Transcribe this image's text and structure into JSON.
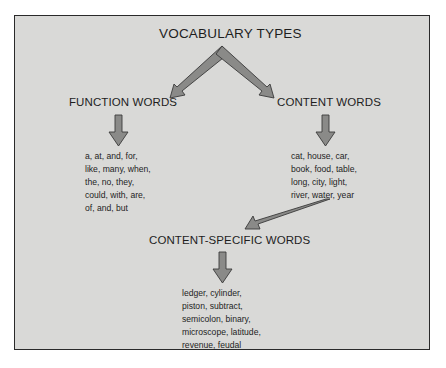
{
  "diagram": {
    "title": "VOCABULARY TYPES",
    "nodes": {
      "function_words": {
        "label": "FUNCTION WORDS",
        "examples": [
          "a, at, and, for,",
          "like, many, when,",
          "the, no, they,",
          "could, with, are,",
          "of, and, but"
        ]
      },
      "content_words": {
        "label": "CONTENT WORDS",
        "examples": [
          "cat, house, car,",
          "book, food, table,",
          "long, city, light,",
          "river, water, year"
        ]
      },
      "content_specific_words": {
        "label": "CONTENT-SPECIFIC WORDS",
        "examples": [
          "ledger, cylinder,",
          "piston, subtract,",
          "semicolon, binary,",
          "microscope, latitude,",
          "revenue, feudal"
        ]
      }
    },
    "edges": [
      {
        "from": "VOCABULARY TYPES",
        "to": "FUNCTION WORDS"
      },
      {
        "from": "VOCABULARY TYPES",
        "to": "CONTENT WORDS"
      },
      {
        "from": "FUNCTION WORDS",
        "to": "function word examples"
      },
      {
        "from": "CONTENT WORDS",
        "to": "content word examples"
      },
      {
        "from": "content word examples",
        "to": "CONTENT-SPECIFIC WORDS"
      },
      {
        "from": "CONTENT-SPECIFIC WORDS",
        "to": "content-specific word examples"
      }
    ],
    "colors": {
      "background": "#d9d9d7",
      "border": "#2a2a2a",
      "arrow_fill": "#8a8a88",
      "arrow_stroke": "#3a3a3a"
    }
  }
}
